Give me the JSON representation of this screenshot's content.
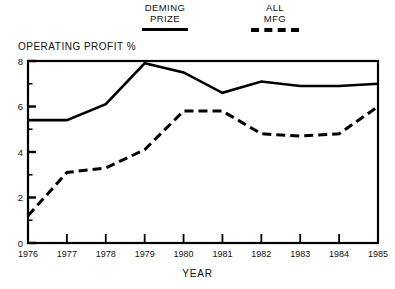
{
  "legend": {
    "entries": [
      {
        "name": "deming-prize",
        "line1": "DEMING",
        "line2": "PRIZE",
        "style": "solid"
      },
      {
        "name": "all-mfg",
        "line1": "ALL",
        "line2": "MFG",
        "style": "dashed"
      }
    ]
  },
  "chart_data": {
    "type": "line",
    "title": "",
    "xlabel": "YEAR",
    "ylabel": "OPERATING PROFIT %",
    "categories": [
      "1976",
      "1977",
      "1978",
      "1979",
      "1980",
      "1981",
      "1982",
      "1983",
      "1984",
      "1985"
    ],
    "x": [
      1976,
      1977,
      1978,
      1979,
      1980,
      1981,
      1982,
      1983,
      1984,
      1985
    ],
    "xlim": [
      1976,
      1985
    ],
    "ylim": [
      0,
      8
    ],
    "ytick_labels": [
      "0",
      "2",
      "4",
      "6",
      "8"
    ],
    "ytick_values": [
      0,
      2,
      4,
      6,
      8
    ],
    "yminor_values": [
      1,
      3,
      5,
      7
    ],
    "grid": false,
    "legend_position": "above-plot",
    "series": [
      {
        "name": "DEMING PRIZE",
        "style": "solid",
        "color": "#000000",
        "values": [
          5.4,
          5.4,
          6.1,
          7.9,
          7.5,
          6.6,
          7.1,
          6.9,
          6.9,
          7.0
        ]
      },
      {
        "name": "ALL MFG",
        "style": "dashed",
        "color": "#000000",
        "values": [
          1.2,
          3.1,
          3.3,
          4.1,
          5.8,
          5.8,
          4.8,
          4.7,
          4.8,
          6.0
        ]
      }
    ]
  },
  "axis": {
    "y_title": "OPERATING PROFIT %",
    "x_title": "YEAR"
  }
}
